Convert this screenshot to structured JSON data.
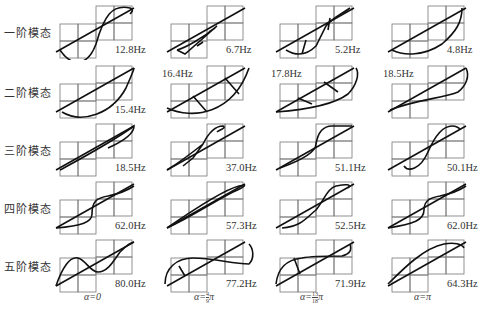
{
  "figure": {
    "row_labels": [
      "一阶模态",
      "二阶模态",
      "三阶模态",
      "四阶模态",
      "五阶模态"
    ],
    "column_labels": [
      {
        "prefix": "α=0",
        "num": "",
        "den": "",
        "suffix": ""
      },
      {
        "prefix": "α=",
        "num": "4",
        "den": "9",
        "suffix": "π"
      },
      {
        "prefix": "α=",
        "num": "13",
        "den": "18",
        "suffix": "π"
      },
      {
        "prefix": "α=π",
        "num": "",
        "den": "",
        "suffix": ""
      }
    ],
    "frequencies": [
      [
        "12.8Hz",
        "6.7Hz",
        "5.2Hz",
        "4.8Hz"
      ],
      [
        "15.4Hz",
        "16.4Hz",
        "17.8Hz",
        "18.5Hz"
      ],
      [
        "18.5Hz",
        "37.0Hz",
        "51.1Hz",
        "50.1Hz"
      ],
      [
        "62.0Hz",
        "57.3Hz",
        "52.5Hz",
        "62.0Hz"
      ],
      [
        "80.0Hz",
        "77.2Hz",
        "71.9Hz",
        "64.3Hz"
      ]
    ],
    "freq_label_position": [
      [
        "br",
        "br",
        "br",
        "br"
      ],
      [
        "br",
        "tl",
        "tl",
        "tl"
      ],
      [
        "br",
        "br",
        "br",
        "br"
      ],
      [
        "br",
        "br",
        "br",
        "br"
      ],
      [
        "br",
        "br",
        "br",
        "br"
      ]
    ]
  }
}
